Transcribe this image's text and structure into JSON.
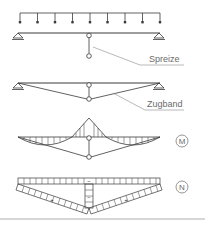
{
  "diagram": {
    "labels": {
      "spreize": "Spreize",
      "zugband": "Zugband",
      "moment": "M",
      "normal_force": "N"
    },
    "signs": {
      "beam_compression": "−",
      "strut_compression": "−",
      "tie_left_tension": "+",
      "tie_right_tension": "+"
    },
    "colors": {
      "line": "#3a3a3a",
      "label": "#6a6a6a",
      "leader": "#8a8a8a",
      "divider": "#9a9a9a"
    },
    "panels": [
      {
        "id": "loaded-beam-with-spreader",
        "elements": [
          "distributed-load",
          "beam",
          "pin-support-left",
          "roller-support-right",
          "spreader-strut"
        ]
      },
      {
        "id": "trussed-beam-with-tie",
        "elements": [
          "beam",
          "supports",
          "spreader-strut",
          "tension-tie"
        ]
      },
      {
        "id": "moment-diagram",
        "elements": [
          "M"
        ]
      },
      {
        "id": "normal-force-diagram",
        "elements": [
          "N"
        ]
      }
    ]
  }
}
